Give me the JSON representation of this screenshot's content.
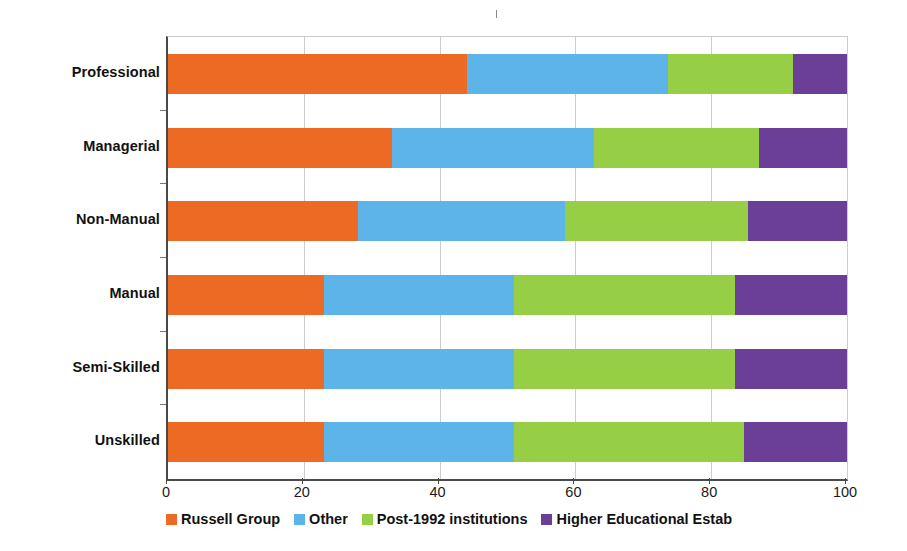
{
  "chart_data": {
    "type": "bar",
    "orientation": "horizontal",
    "stacked": true,
    "stack_mode": "percent",
    "title": "",
    "subtitle": "",
    "xlabel": "",
    "ylabel": "",
    "xlim": [
      0,
      100
    ],
    "xticks": [
      0,
      20,
      40,
      60,
      80,
      100
    ],
    "xtick_labels": [
      "0",
      "20",
      "40",
      "60",
      "80",
      "100"
    ],
    "grid": "vertical",
    "legend_position": "bottom",
    "categories": [
      "Professional",
      "Managerial",
      "Non-Manual",
      "Manual",
      "Semi-Skilled",
      "Unskilled"
    ],
    "series": [
      {
        "name": "Russell Group",
        "color": "#ec6a23",
        "values": [
          44,
          33,
          28,
          23,
          23,
          23
        ]
      },
      {
        "name": "Other",
        "color": "#5cb4e8",
        "values": [
          29.6,
          29.7,
          30.5,
          28,
          28,
          28
        ]
      },
      {
        "name": "Post-1992 institutions",
        "color": "#96ce45",
        "values": [
          18.4,
          24.3,
          26.9,
          32.5,
          32.5,
          33.8
        ]
      },
      {
        "name": "Higher Educational Estab",
        "color": "#6b3f98",
        "values": [
          8,
          13,
          14.6,
          16.5,
          16.5,
          15.2
        ]
      }
    ],
    "cumulative_boundaries": {
      "Professional": [
        44,
        73.6,
        92,
        100
      ],
      "Managerial": [
        33,
        62.7,
        87,
        100
      ],
      "Non-Manual": [
        28,
        58.5,
        85.4,
        100
      ],
      "Manual": [
        23,
        51,
        83.5,
        100
      ],
      "Semi-Skilled": [
        23,
        51,
        83.5,
        100
      ],
      "Unskilled": [
        23,
        51,
        84.8,
        100
      ]
    }
  },
  "legend": {
    "items": [
      {
        "label": "Russell Group",
        "color": "#ec6a23"
      },
      {
        "label": "Other",
        "color": "#5cb4e8"
      },
      {
        "label": "Post-1992 institutions",
        "color": "#96ce45"
      },
      {
        "label": "Higher Educational Estab",
        "color": "#6b3f98"
      }
    ]
  },
  "axis": {
    "x_tick_labels": [
      "0",
      "20",
      "40",
      "60",
      "80",
      "100"
    ]
  },
  "categories": {
    "labels": [
      "Professional",
      "Managerial",
      "Non-Manual",
      "Manual",
      "Semi-Skilled",
      "Unskilled"
    ]
  }
}
